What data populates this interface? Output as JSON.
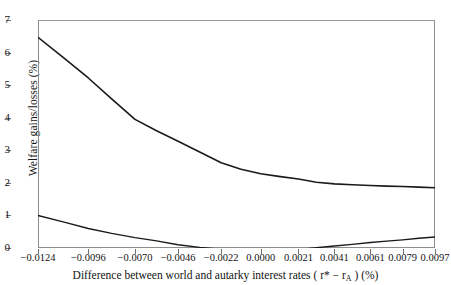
{
  "chart_data": {
    "type": "line",
    "title": "",
    "xlabel": "Difference between world and autarky interest rates (r* − r_A) (%)",
    "ylabel": "Welfare gains/losses (%)",
    "xlim": [
      -0.0124,
      0.0097
    ],
    "ylim": [
      0,
      7
    ],
    "grid": false,
    "legend": "none",
    "xtick_labels": [
      "−0.0124",
      "−0.0096",
      "−0.0070",
      "−0.0046",
      "−0.0022",
      "0.0000",
      "0.0021",
      "0.0041",
      "0.0061",
      "0.0079",
      "0.0097"
    ],
    "xtick_values": [
      -0.0124,
      -0.0096,
      -0.007,
      -0.0046,
      -0.0022,
      0.0,
      0.0021,
      0.0041,
      0.0061,
      0.0079,
      0.0097
    ],
    "ytick_labels": [
      "0",
      "1",
      "2",
      "3",
      "4",
      "5",
      "6",
      "7"
    ],
    "ytick_values": [
      0,
      1,
      2,
      3,
      4,
      5,
      6,
      7
    ],
    "series": [
      {
        "name": "upper-curve",
        "color": "#1a1a1a",
        "x": [
          -0.0124,
          -0.011,
          -0.0096,
          -0.0083,
          -0.007,
          -0.0058,
          -0.0046,
          -0.0034,
          -0.0022,
          -0.0011,
          0.0,
          0.001,
          0.0021,
          0.0031,
          0.0041,
          0.0051,
          0.0061,
          0.007,
          0.0079,
          0.0088,
          0.0097
        ],
        "values": [
          6.47,
          5.85,
          5.22,
          4.58,
          3.95,
          3.6,
          3.28,
          2.95,
          2.62,
          2.42,
          2.28,
          2.2,
          2.12,
          2.02,
          1.97,
          1.94,
          1.92,
          1.9,
          1.89,
          1.87,
          1.85
        ]
      },
      {
        "name": "lower-curve",
        "color": "#1a1a1a",
        "x": [
          -0.0124,
          -0.011,
          -0.0096,
          -0.0083,
          -0.007,
          -0.0058,
          -0.0046,
          -0.0034,
          -0.0022,
          -0.0011,
          0.0,
          0.001,
          0.0021,
          0.0031,
          0.0041,
          0.0051,
          0.0061,
          0.007,
          0.0079,
          0.0088,
          0.0097
        ],
        "values": [
          1.0,
          0.8,
          0.6,
          0.45,
          0.32,
          0.22,
          0.1,
          0.02,
          -0.04,
          -0.05,
          -0.05,
          -0.05,
          -0.05,
          0.01,
          0.06,
          0.11,
          0.17,
          0.21,
          0.25,
          0.3,
          0.34
        ]
      }
    ]
  },
  "axis": {
    "y_title": "Welfare gains/losses (%)",
    "x_title_prefix": "Difference between world and autarky interest rates  ( r",
    "x_title_star": "*",
    "x_title_mid": " − r",
    "x_title_sub": "A",
    "x_title_suffix": " ) (%)"
  }
}
